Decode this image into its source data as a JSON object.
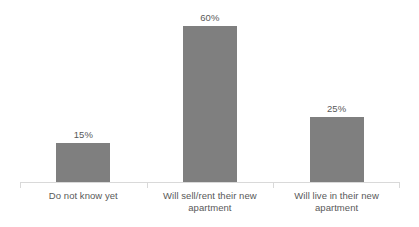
{
  "chart_data": {
    "type": "bar",
    "title": "",
    "subtitle": "",
    "xlabel": "",
    "ylabel": "",
    "categories": [
      "Do not know yet",
      "Will sell/rent their new apartment",
      "Will live in their new apartment"
    ],
    "category_lines": [
      [
        "Do not know yet"
      ],
      [
        "Will sell/rent their new",
        "apartment"
      ],
      [
        "Will live in their new",
        "apartment"
      ]
    ],
    "values": [
      15,
      60,
      25
    ],
    "value_labels": [
      "15%",
      "60%",
      "25%"
    ],
    "ylim": [
      0,
      70
    ],
    "grid": false,
    "legend": false,
    "legend_position": "none",
    "axis_visible": {
      "x": true,
      "y": false
    },
    "annotations": []
  },
  "style": {
    "background": "#ffffff",
    "bar_color": "#7f7f7f",
    "axis_color": "#d9d9d9",
    "label_color": "#595959",
    "value_color": "#595959"
  }
}
